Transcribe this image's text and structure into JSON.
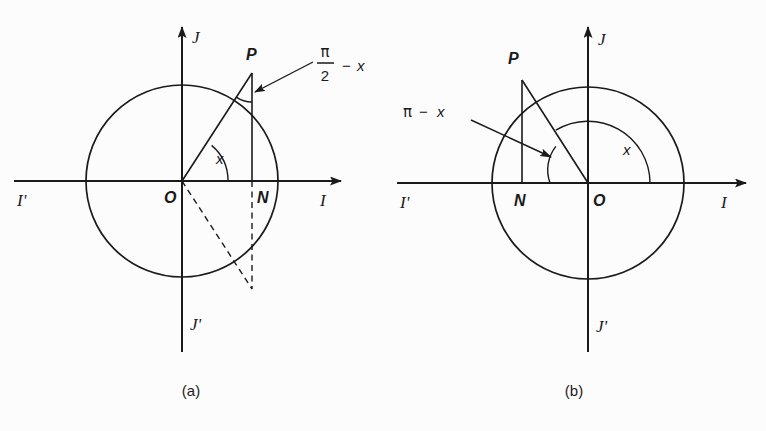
{
  "figure": {
    "background_color": "#fcfcfc",
    "ink_color": "#1a1a1a",
    "panels": [
      {
        "id": "a",
        "caption": "(a)",
        "geometry": {
          "center_x": 182,
          "center_y": 181,
          "radius": 96,
          "point_p_x": 252,
          "point_p_y": 73,
          "foot_n_x": 252,
          "foot_n_y": 181,
          "mirror_p_x": 252,
          "mirror_p_y": 289,
          "axis_left_x": 14,
          "axis_right_x": 350,
          "axis_top_y": 18,
          "axis_bottom_y": 352
        },
        "axis_labels": {
          "positive_x": "I",
          "negative_x": "I'",
          "positive_y": "J",
          "negative_y": "J'"
        },
        "points": {
          "origin": "O",
          "circle_point": "P",
          "foot": "N"
        },
        "angles": [
          {
            "name": "central-angle",
            "label": "x",
            "vertex": "O",
            "description": "angle from positive I axis to OP"
          },
          {
            "name": "apex-angle",
            "label_numerator": "π",
            "label_denominator": "2",
            "label_operator": "−",
            "label_term": "x",
            "label_plain": "π/2 − x",
            "vertex": "P",
            "description": "angle at P between PO and PN"
          }
        ]
      },
      {
        "id": "b",
        "caption": "(b)",
        "geometry": {
          "center_x": 205,
          "center_y": 183,
          "radius": 96,
          "point_p_x": 139,
          "point_p_y": 80,
          "foot_n_x": 139,
          "foot_n_y": 183,
          "axis_left_x": 14,
          "axis_right_x": 372,
          "axis_top_y": 18,
          "axis_bottom_y": 352
        },
        "axis_labels": {
          "positive_x": "I",
          "negative_x": "I'",
          "positive_y": "J",
          "negative_y": "J'"
        },
        "points": {
          "origin": "O",
          "circle_point": "P",
          "foot": "N"
        },
        "angles": [
          {
            "name": "central-angle",
            "label": "x",
            "vertex": "O",
            "description": "large arc from positive I axis counterclockwise to OP"
          },
          {
            "name": "supplement-angle",
            "label_greek": "π",
            "label_operator": "−",
            "label_term": "x",
            "label_plain": "π − x",
            "vertex": "O",
            "description": "small arc between OP and negative I axis direction"
          }
        ]
      }
    ]
  }
}
